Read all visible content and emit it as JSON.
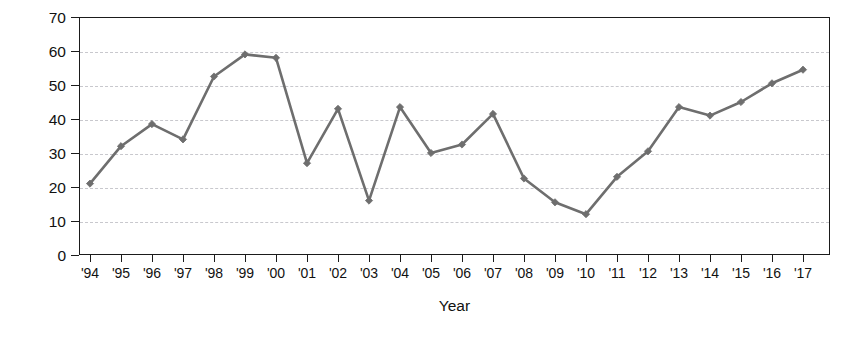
{
  "chart_data": {
    "type": "line",
    "title": "",
    "xlabel": "Year",
    "ylabel": "Percentage Responding “in right direction”",
    "ylabel_line1": "Percentage Responding",
    "ylabel_line2": "“in right direction”",
    "categories": [
      "'94",
      "'95",
      "'96",
      "'97",
      "'98",
      "'99",
      "'00",
      "'01",
      "'02",
      "'03",
      "'04",
      "'05",
      "'06",
      "'07",
      "'08",
      "'09",
      "'10",
      "'11",
      "'12",
      "'13",
      "'14",
      "'15",
      "'16",
      "'17"
    ],
    "x": [
      1994,
      1995,
      1996,
      1997,
      1998,
      1999,
      2000,
      2001,
      2002,
      2003,
      2004,
      2005,
      2006,
      2007,
      2008,
      2009,
      2010,
      2011,
      2012,
      2013,
      2014,
      2015,
      2016,
      2017
    ],
    "values": [
      21,
      32,
      38.5,
      34,
      52.5,
      59,
      58,
      27,
      43,
      16,
      43.5,
      30,
      32.5,
      41.5,
      22.5,
      15.5,
      12,
      23,
      30.5,
      43.5,
      41,
      45,
      50.5,
      54.5
    ],
    "series": [
      {
        "name": "Percentage responding “in right direction”",
        "values": [
          21,
          32,
          38.5,
          34,
          52.5,
          59,
          58,
          27,
          43,
          16,
          43.5,
          30,
          32.5,
          41.5,
          22.5,
          15.5,
          12,
          23,
          30.5,
          43.5,
          41,
          45,
          50.5,
          54.5
        ]
      }
    ],
    "ylim": [
      0,
      70
    ],
    "yticks": [
      0,
      10,
      20,
      30,
      40,
      50,
      60,
      70
    ],
    "ytick_labels": [
      "0",
      "10",
      "20",
      "30",
      "40",
      "50",
      "60",
      "70"
    ],
    "grid": true,
    "grid_axis": "y",
    "grid_style": "dashed",
    "legend": false,
    "legend_position": "none",
    "marker": "diamond",
    "line_color": "#6e6e6e",
    "marker_color": "#6e6e6e",
    "axis_color": "#1b1b1b",
    "grid_color": "#c8c8cd",
    "background_color": "#ffffff"
  }
}
